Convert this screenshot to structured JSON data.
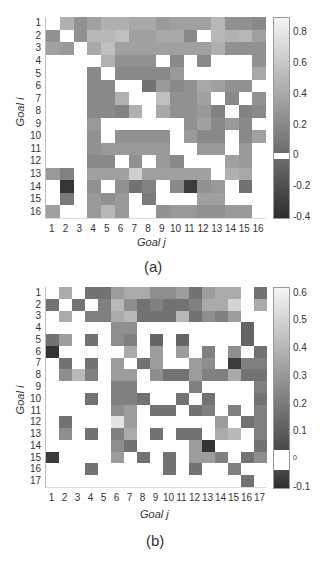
{
  "chart_data": [
    {
      "type": "heatmap",
      "panel": "(a)",
      "xlabel": "Goal j",
      "ylabel": "Goal i",
      "x_ticks": [
        "1",
        "2",
        "3",
        "4",
        "5",
        "6",
        "7",
        "8",
        "9",
        "10",
        "11",
        "12",
        "13",
        "14",
        "15",
        "16"
      ],
      "y_ticks": [
        "1",
        "2",
        "3",
        "4",
        "5",
        "6",
        "7",
        "8",
        "9",
        "10",
        "11",
        "12",
        "13",
        "14",
        "15",
        "16"
      ],
      "colorbar": {
        "min": -0.4,
        "max": 0.9,
        "ticks": [
          "0.8",
          "0.6",
          "0.4",
          "0.2",
          "0",
          "-0.2",
          "-0.4"
        ],
        "zero_band": "white"
      },
      "grid": false,
      "values": [
        [
          0,
          0.45,
          0.25,
          0.35,
          0.45,
          0.45,
          0.4,
          0.4,
          0.3,
          0.35,
          0.35,
          0.35,
          0.5,
          0.25,
          0.25,
          0.2
        ],
        [
          0.25,
          0,
          0.25,
          0.5,
          0.5,
          0.55,
          0.35,
          0.35,
          0.4,
          0.4,
          0.2,
          0,
          0.5,
          0.45,
          0.5,
          0.35
        ],
        [
          0.35,
          0.3,
          0,
          0.4,
          0.55,
          0.35,
          0.35,
          0.35,
          0.35,
          0.35,
          0.35,
          0.35,
          0.45,
          0.25,
          0.25,
          0.25
        ],
        [
          0,
          0,
          0,
          0,
          0.45,
          0.25,
          0.25,
          0.25,
          0,
          0.2,
          0,
          0.2,
          0,
          0,
          0,
          0.25
        ],
        [
          0,
          0,
          0,
          0.2,
          0,
          0.2,
          0.2,
          0.2,
          0.2,
          0.3,
          0,
          0,
          0,
          0,
          0,
          0.4
        ],
        [
          0,
          0,
          0,
          0.2,
          0.2,
          0,
          0,
          0.05,
          0.3,
          0.2,
          0.25,
          0.4,
          0.35,
          0.25,
          0.25,
          0
        ],
        [
          0,
          0,
          0,
          0.2,
          0.2,
          0.45,
          0,
          0,
          0.55,
          0.25,
          0.25,
          0.35,
          0,
          0.2,
          0,
          0.25
        ],
        [
          0,
          0,
          0,
          0.2,
          0.2,
          0.15,
          0.45,
          0,
          0.4,
          0.25,
          0.25,
          0.3,
          0.15,
          0,
          0.15,
          0.2
        ],
        [
          0,
          0,
          0,
          0.3,
          0,
          0,
          0,
          0,
          0,
          0,
          0.25,
          0.35,
          0.2,
          0.3,
          0.2,
          0
        ],
        [
          0,
          0,
          0,
          0.25,
          0,
          0.25,
          0.25,
          0.25,
          0.25,
          0,
          0.3,
          0.2,
          0.2,
          0,
          0.2,
          0.35
        ],
        [
          0,
          0,
          0,
          0.25,
          0.3,
          0.3,
          0.3,
          0.3,
          0.3,
          0,
          0,
          0.3,
          0.3,
          0,
          0.3,
          0
        ],
        [
          0,
          0,
          0,
          0.2,
          0.2,
          0,
          0.25,
          0,
          0.3,
          0.2,
          0,
          0,
          0,
          0.35,
          0.3,
          0
        ],
        [
          0.3,
          0.15,
          0,
          0.35,
          0.35,
          0.35,
          0.65,
          0.35,
          0.35,
          0.35,
          0.35,
          0.35,
          0,
          0.45,
          0.4,
          0
        ],
        [
          0,
          -0.35,
          0,
          0.25,
          0,
          0.25,
          0.05,
          0.15,
          0,
          0.2,
          -0.3,
          0.25,
          0.3,
          0,
          0.05,
          0
        ],
        [
          0,
          0.1,
          0,
          0.3,
          0.25,
          0.3,
          0,
          0.1,
          0,
          0,
          0,
          0.35,
          0.35,
          0,
          0,
          0
        ],
        [
          0.35,
          0,
          0,
          0.3,
          0.5,
          0.3,
          0,
          0,
          0.25,
          0.3,
          0.3,
          0.25,
          0.25,
          0.3,
          0.3,
          0
        ]
      ]
    },
    {
      "type": "heatmap",
      "panel": "(b)",
      "xlabel": "Goal j",
      "ylabel": "Goal i",
      "x_ticks": [
        "1",
        "2",
        "3",
        "4",
        "5",
        "6",
        "7",
        "8",
        "9",
        "10",
        "11",
        "12",
        "13",
        "14",
        "15",
        "16",
        "17"
      ],
      "y_ticks": [
        "1",
        "2",
        "3",
        "4",
        "5",
        "6",
        "7",
        "8",
        "9",
        "10",
        "11",
        "12",
        "13",
        "14",
        "15",
        "16",
        "17"
      ],
      "colorbar": {
        "min": -0.1,
        "max": 0.62,
        "ticks": [
          "0.6",
          "0.5",
          "0.4",
          "0.3",
          "0.2",
          "0.1",
          "0",
          "-0.1"
        ],
        "zero_band": "white"
      },
      "grid": false,
      "values": [
        [
          0,
          0.35,
          0,
          0.15,
          0.15,
          0.3,
          0.35,
          0.35,
          0.25,
          0.25,
          0.3,
          0.15,
          0.3,
          0.35,
          0.35,
          0,
          0.15
        ],
        [
          0.15,
          0,
          0.15,
          0,
          0.2,
          0.4,
          0.25,
          0.15,
          0.2,
          0.15,
          0.15,
          0.2,
          0.35,
          0.35,
          0.5,
          0,
          0.35
        ],
        [
          0,
          0.35,
          0,
          0.2,
          0.2,
          0.35,
          0.4,
          0.15,
          0.15,
          0.15,
          0.4,
          0.15,
          0.25,
          0.2,
          0.3,
          0,
          0
        ],
        [
          0,
          0,
          0,
          0,
          0,
          0.25,
          0.25,
          0,
          0,
          0,
          0,
          0,
          0,
          0,
          0,
          0.1,
          0
        ],
        [
          0.15,
          0.3,
          0,
          0.15,
          0,
          0.25,
          0.2,
          0,
          0.1,
          0,
          0.1,
          0,
          0,
          0,
          0,
          0.1,
          0
        ],
        [
          -0.08,
          0,
          0,
          0,
          0,
          0,
          0.35,
          0,
          0.3,
          0,
          0.3,
          0,
          0.2,
          0,
          0.25,
          0,
          0.15
        ],
        [
          0,
          0.15,
          0,
          0.15,
          0,
          0.3,
          0,
          0.15,
          0.3,
          0,
          0,
          0.3,
          0.25,
          0,
          -0.05,
          0.2,
          0.2
        ],
        [
          0,
          0.25,
          0.4,
          0.2,
          0,
          0.3,
          0.3,
          0,
          0.25,
          0.15,
          0.15,
          0.3,
          0.2,
          0.2,
          0.35,
          0.15,
          0.15
        ],
        [
          0,
          0,
          0,
          0,
          0,
          0.2,
          0.2,
          0,
          0,
          0,
          0,
          0.2,
          0,
          0,
          0,
          0,
          0.2
        ],
        [
          0,
          0,
          0,
          0.15,
          0,
          0.2,
          0.2,
          0.15,
          0,
          0,
          0.15,
          0,
          0.15,
          0,
          0,
          0,
          0.15
        ],
        [
          0,
          0,
          0,
          0,
          0,
          0.25,
          0.3,
          0,
          0.15,
          0.15,
          0,
          0.15,
          0.2,
          0,
          0.2,
          0,
          0.2
        ],
        [
          0,
          0.15,
          0,
          0,
          0,
          0.55,
          0.3,
          0,
          0,
          0,
          0,
          0,
          0,
          0.3,
          0,
          0.15,
          0.2
        ],
        [
          0,
          0.25,
          0,
          0.15,
          0,
          0.2,
          0.35,
          0,
          0.15,
          0,
          0.15,
          0.15,
          0,
          0.35,
          0.4,
          0,
          0.2
        ],
        [
          0,
          0,
          0,
          0,
          0,
          0.25,
          0.15,
          0,
          0,
          0,
          0,
          0.3,
          -0.08,
          0,
          0,
          0,
          0.15
        ],
        [
          -0.05,
          0,
          0,
          0,
          0,
          0.3,
          0,
          0.15,
          0,
          0.15,
          0,
          0.3,
          0.3,
          0.2,
          0,
          0.15,
          0.25
        ],
        [
          0,
          0,
          0,
          0.15,
          0,
          0,
          0,
          0,
          0,
          0.15,
          0,
          0.15,
          0,
          0,
          0.2,
          0,
          0
        ],
        [
          0,
          0,
          0,
          0,
          0,
          0,
          0,
          0,
          0,
          0,
          0,
          0,
          0,
          0,
          0,
          0.15,
          0
        ]
      ]
    }
  ],
  "panels": {
    "a": {
      "caption": "(a)",
      "xlabel": "Goal j",
      "ylabel": "Goal i"
    },
    "b": {
      "caption": "(b)",
      "xlabel": "Goal j",
      "ylabel": "Goal i"
    }
  }
}
